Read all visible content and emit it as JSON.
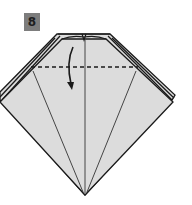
{
  "step": {
    "number": "8",
    "badge_color": "#7d7d7d"
  },
  "diagram": {
    "paper_color": "#dcdcdc",
    "line_color": "#1a1a1a",
    "elements": [
      "layered-kite-shape",
      "valley-fold-dashed-line",
      "curved-fold-down-arrow",
      "center-crease",
      "diagonal-creases"
    ],
    "instruction": "valley fold top flap down along dashed line"
  }
}
